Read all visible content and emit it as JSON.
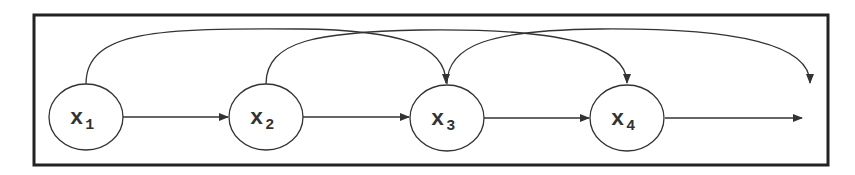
{
  "diagram": {
    "type": "directed-graph",
    "frame": {
      "stroke": "#222222"
    },
    "colors": {
      "stroke": "#333333",
      "background": "#ffffff"
    },
    "nodes": [
      {
        "id": "x1",
        "base": "x",
        "subscript": "1",
        "cx": 86,
        "cy": 117
      },
      {
        "id": "x2",
        "base": "x",
        "subscript": "2",
        "cx": 266,
        "cy": 117
      },
      {
        "id": "x3",
        "base": "x",
        "subscript": "3",
        "cx": 447,
        "cy": 118
      },
      {
        "id": "x4",
        "base": "x",
        "subscript": "4",
        "cx": 627,
        "cy": 118
      }
    ],
    "edges": [
      {
        "from": "x1",
        "to": "x2",
        "kind": "straight"
      },
      {
        "from": "x2",
        "to": "x3",
        "kind": "straight"
      },
      {
        "from": "x3",
        "to": "x4",
        "kind": "straight"
      },
      {
        "from": "x4",
        "to": "out",
        "kind": "straight"
      },
      {
        "from": "x1",
        "to": "x3",
        "kind": "arc"
      },
      {
        "from": "x2",
        "to": "x4",
        "kind": "arc"
      },
      {
        "from": "x3",
        "to": "out",
        "kind": "arc"
      }
    ]
  }
}
